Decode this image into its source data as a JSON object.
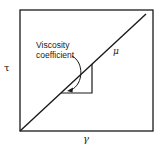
{
  "figure": {
    "y_axis_label": "τ",
    "x_axis_label": "γ",
    "line_label": "μ",
    "annotation": {
      "line1": "Viscosity",
      "line2": "coefficient"
    },
    "colors": {
      "stroke": "#1a1a1a",
      "background": "#ffffff"
    }
  }
}
